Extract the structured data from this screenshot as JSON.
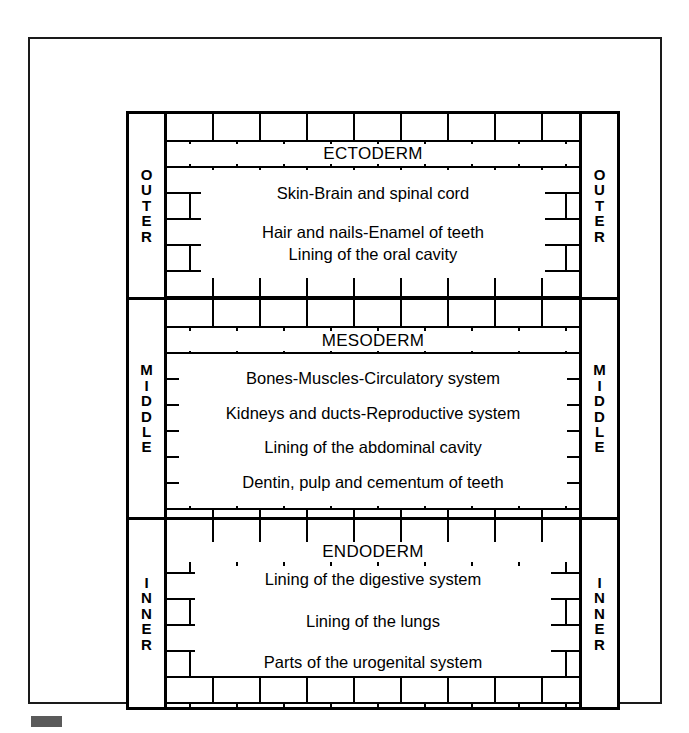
{
  "diagram": {
    "type": "brick-wall-layer-diagram",
    "corner_mark_color": "#5a5a5a",
    "line_color": "#000000",
    "background_color": "#ffffff"
  },
  "layers": [
    {
      "id": "ectoderm",
      "name": "ECTODERM",
      "side_label": "OUTER",
      "side_label_letters": "O\nU\nT\nE\nR",
      "derivatives": [
        "Skin-Brain and spinal cord",
        "Hair and nails-Enamel of teeth",
        "Lining of the oral cavity"
      ]
    },
    {
      "id": "mesoderm",
      "name": "MESODERM",
      "side_label": "MIDDLE",
      "side_label_letters": "M\nI\nD\nD\nL\nE",
      "derivatives": [
        "Bones-Muscles-Circulatory  system",
        "Kidneys and ducts-Reproductive system",
        "Lining of the abdominal cavity",
        "Dentin, pulp and  cementum of  teeth"
      ]
    },
    {
      "id": "endoderm",
      "name": "ENDODERM",
      "side_label": "INNER",
      "side_label_letters": "I\nN\nN\nE\nR",
      "derivatives": [
        "Lining of the digestive system",
        "Lining of the lungs",
        "Parts of the urogenital system"
      ]
    }
  ]
}
